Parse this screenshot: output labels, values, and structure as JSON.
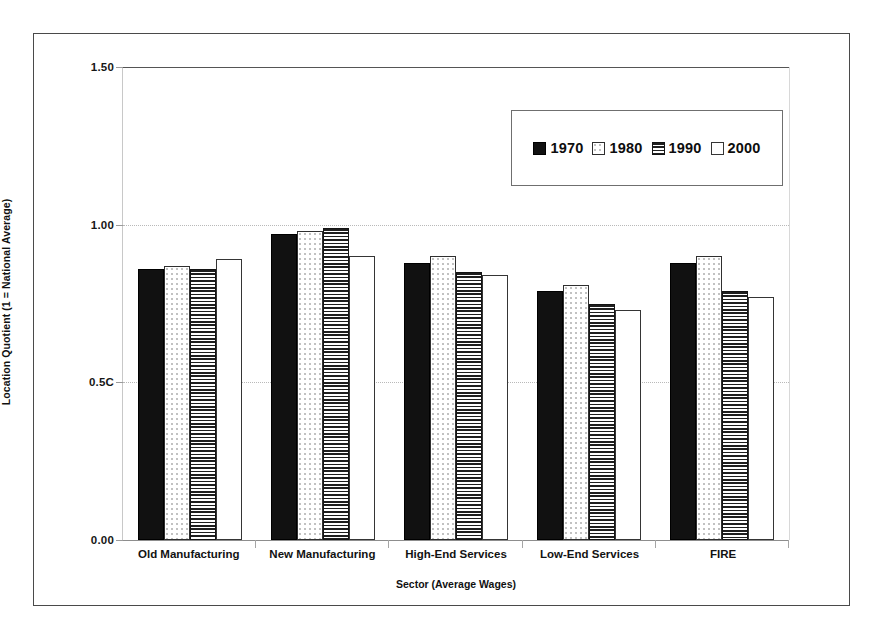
{
  "chart_data": {
    "type": "bar",
    "title": "",
    "xlabel": "Sector (Average Wages)",
    "ylabel": "Location Quotient (1 = National Average)",
    "ylim": [
      0.0,
      1.5
    ],
    "yticks": [
      "0.00",
      "0.5C",
      "1.00",
      "1.50"
    ],
    "ytick_values": [
      0.0,
      0.5,
      1.0,
      1.5
    ],
    "grid": true,
    "legend_position": "upper-right inside plot",
    "categories": [
      "Old Manufacturing",
      "New Manufacturing",
      "High-End Services",
      "Low-End Services",
      "FIRE"
    ],
    "series": [
      {
        "name": "1970",
        "pattern": "solid-black",
        "values": [
          0.86,
          0.97,
          0.88,
          0.79,
          0.88
        ]
      },
      {
        "name": "1980",
        "pattern": "white-dots",
        "values": [
          0.87,
          0.98,
          0.9,
          0.81,
          0.9
        ]
      },
      {
        "name": "1990",
        "pattern": "horizontal-lines",
        "values": [
          0.86,
          0.99,
          0.85,
          0.75,
          0.79
        ]
      },
      {
        "name": "2000",
        "pattern": "plain-white",
        "values": [
          0.89,
          0.9,
          0.84,
          0.73,
          0.77
        ]
      }
    ]
  },
  "colors": {
    "frame": "#4a4a4a",
    "gridline": "#b9b9b9",
    "axis_top_line": "#555555",
    "baseline": "#8d8d8d",
    "series_1970": "#111111",
    "series_1980": "#ffffff",
    "series_1990": "#1f1f1f",
    "series_2000": "#ffffff",
    "text": "#111111"
  }
}
